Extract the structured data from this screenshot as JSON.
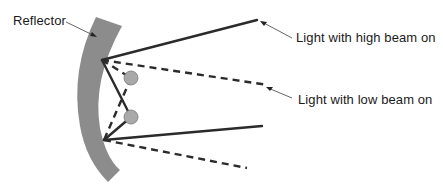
{
  "diagram": {
    "labels": {
      "reflector": "Reflector",
      "high_beam": "Light with high beam on",
      "low_beam": "Light with low beam on"
    },
    "colors": {
      "reflector_fill": "#8c8c8c",
      "bulb_fill": "#a9a9a9",
      "ray": "#2b2b2b",
      "leader": "#555555"
    },
    "elements": {
      "reflector": "curved reflector",
      "bulbs": [
        "upper bulb (low beam filament)",
        "lower bulb (high beam filament)"
      ],
      "rays": {
        "high_beam": "solid lines",
        "low_beam": "dashed lines"
      }
    }
  }
}
